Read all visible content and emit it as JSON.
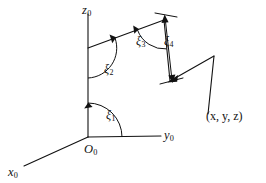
{
  "figure": {
    "kind": "coordinate-frame-diagram",
    "background_color": "#ffffff",
    "stroke_color": "#111111",
    "axes": [
      {
        "id": "z0",
        "base": "z",
        "subscript": "0",
        "label_x": 82,
        "label_y": 4
      },
      {
        "id": "y0",
        "base": "y",
        "subscript": "0",
        "label_x": 164,
        "label_y": 129
      },
      {
        "id": "x0",
        "base": "x",
        "subscript": "0",
        "label_x": 8,
        "label_y": 166
      }
    ],
    "origin": {
      "id": "O0",
      "base": "O",
      "subscript": "0",
      "label_x": 84,
      "label_y": 143
    },
    "angles": [
      {
        "id": "xi1",
        "base": "ξ",
        "subscript": "1",
        "label_x": 106,
        "label_y": 109
      },
      {
        "id": "xi2",
        "base": "ξ",
        "subscript": "2",
        "label_x": 104,
        "label_y": 63
      },
      {
        "id": "xi3",
        "base": "ξ",
        "subscript": "3",
        "label_x": 136,
        "label_y": 35
      },
      {
        "id": "xi4",
        "base": "ξ",
        "subscript": "4",
        "label_x": 164,
        "label_y": 35
      }
    ],
    "point": {
      "id": "xyz",
      "text": "(x, y, z)",
      "label_x": 206,
      "label_y": 110
    }
  },
  "chart_data": {
    "type": "diagram",
    "title": "",
    "labels": [
      "z0",
      "y0",
      "x0",
      "O0",
      "ξ1",
      "ξ2",
      "ξ3",
      "ξ4",
      "(x, y, z)"
    ],
    "geometry": {
      "origin_px": [
        88,
        137
      ],
      "z_axis_tip_px": [
        88,
        14
      ],
      "y_axis_tip_px": [
        161,
        136
      ],
      "x_axis_tip_px": [
        24,
        166
      ],
      "link1_start_px": [
        88,
        48
      ],
      "link1_end_px": [
        164,
        20
      ],
      "link2_start_px": [
        164,
        20
      ],
      "link2_end_px": [
        170,
        80
      ],
      "link3_start_px": [
        170,
        80
      ],
      "link3_end_px": [
        214,
        56
      ],
      "link4_start_px": [
        214,
        56
      ],
      "link4_end_px": [
        208,
        114
      ]
    }
  }
}
